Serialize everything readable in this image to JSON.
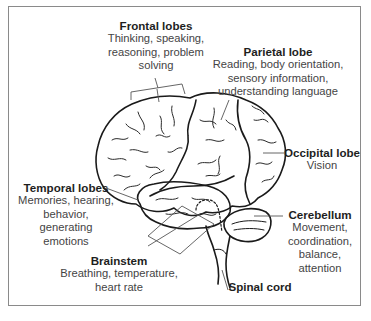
{
  "diagram": {
    "type": "labeled-anatomy-illustration",
    "labels": [
      {
        "id": "frontal",
        "title": "Frontal lobes",
        "lines": [
          "Thinking, speaking,",
          "reasoning, problem",
          "solving"
        ]
      },
      {
        "id": "parietal",
        "title": "Parietal lobe",
        "lines": [
          "Reading, body orientation,",
          "sensory information,",
          "understanding language"
        ]
      },
      {
        "id": "occipital",
        "title": "Occipital lobe",
        "lines": [
          "Vision"
        ]
      },
      {
        "id": "temporal",
        "title": "Temporal lobes",
        "lines": [
          "Memories, hearing,",
          "behavior, generating",
          "emotions"
        ]
      },
      {
        "id": "cerebellum",
        "title": "Cerebellum",
        "lines": [
          "Movement,",
          "coordination,",
          "balance,",
          "attention"
        ]
      },
      {
        "id": "brainstem",
        "title": "Brainstem",
        "lines": [
          "Breathing, temperature,",
          "heart rate"
        ]
      },
      {
        "id": "spinal",
        "title": "Spinal cord",
        "lines": []
      }
    ]
  },
  "colors": {
    "line": "#1a1a1a",
    "leader": "#555555",
    "border": "#8a8a8a",
    "text": "#333333"
  }
}
